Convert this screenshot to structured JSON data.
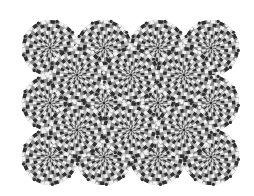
{
  "image": {
    "title": "Rotating snakes optical illusion",
    "width": 254,
    "height": 196,
    "background": "#ffffff"
  },
  "pattern": {
    "radius": 28,
    "rings": 7,
    "segments": 36,
    "colors": [
      "#2e2e2e",
      "#8c8c8c",
      "#f2f2f2",
      "#c4c4c4"
    ],
    "center_color": "#2b2b2b",
    "center_dot_radius": 1.2
  },
  "discs": [
    {
      "cx": 50,
      "cy": 48,
      "layer": 0
    },
    {
      "cx": 104,
      "cy": 48,
      "layer": 0
    },
    {
      "cx": 158,
      "cy": 48,
      "layer": 0
    },
    {
      "cx": 211,
      "cy": 48,
      "layer": 0
    },
    {
      "cx": 50,
      "cy": 103,
      "layer": 0
    },
    {
      "cx": 104,
      "cy": 103,
      "layer": 0
    },
    {
      "cx": 158,
      "cy": 103,
      "layer": 0
    },
    {
      "cx": 211,
      "cy": 103,
      "layer": 0
    },
    {
      "cx": 50,
      "cy": 157,
      "layer": 0
    },
    {
      "cx": 104,
      "cy": 157,
      "layer": 0
    },
    {
      "cx": 158,
      "cy": 157,
      "layer": 0
    },
    {
      "cx": 211,
      "cy": 157,
      "layer": 0
    },
    {
      "cx": 77,
      "cy": 75,
      "layer": 1
    },
    {
      "cx": 131,
      "cy": 75,
      "layer": 1
    },
    {
      "cx": 184,
      "cy": 75,
      "layer": 1
    },
    {
      "cx": 77,
      "cy": 130,
      "layer": 1
    },
    {
      "cx": 131,
      "cy": 130,
      "layer": 1
    },
    {
      "cx": 184,
      "cy": 130,
      "layer": 1
    }
  ]
}
